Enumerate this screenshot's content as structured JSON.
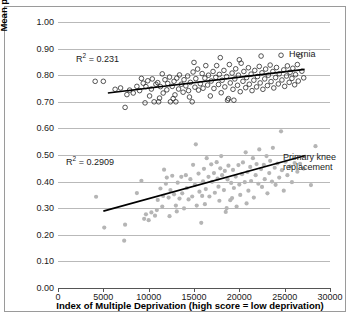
{
  "chart_data": {
    "type": "scatter",
    "title": "",
    "xlabel": "Index of Multiple Deprivation (high score = low deprivation)",
    "ylabel": "Mean pre operative EQ 5D index score",
    "xlim": [
      0,
      30000
    ],
    "ylim": [
      0.0,
      1.0
    ],
    "xticks": [
      "0",
      "5000",
      "10000",
      "15000",
      "20000",
      "25000",
      "30000"
    ],
    "xtick_values": [
      0,
      5000,
      10000,
      15000,
      20000,
      25000,
      30000
    ],
    "yticks": [
      "0.00",
      "0.10",
      "0.20",
      "0.30",
      "0.40",
      "0.50",
      "0.60",
      "0.70",
      "0.80",
      "0.90",
      "1.00"
    ],
    "ytick_values": [
      0.0,
      0.1,
      0.2,
      0.3,
      0.4,
      0.5,
      0.6,
      0.7,
      0.8,
      0.9,
      1.0
    ],
    "grid": true,
    "legend_position": "inline-annotation",
    "series": [
      {
        "name": "Hernia",
        "marker": "open-circle",
        "color": "#2b2b2b",
        "r_squared_label": "0.231",
        "trendline": {
          "x0": 5500,
          "y0": 0.733,
          "x1": 27200,
          "y1": 0.822
        },
        "points": [
          [
            4100,
            0.777
          ],
          [
            5000,
            0.777
          ],
          [
            6300,
            0.747
          ],
          [
            6900,
            0.752
          ],
          [
            7400,
            0.679
          ],
          [
            7600,
            0.727
          ],
          [
            7900,
            0.744
          ],
          [
            8300,
            0.733
          ],
          [
            8700,
            0.758
          ],
          [
            9000,
            0.742
          ],
          [
            9200,
            0.788
          ],
          [
            9400,
            0.77
          ],
          [
            9600,
            0.696
          ],
          [
            9700,
            0.757
          ],
          [
            9900,
            0.779
          ],
          [
            10100,
            0.722
          ],
          [
            10300,
            0.748
          ],
          [
            10400,
            0.786
          ],
          [
            10600,
            0.7
          ],
          [
            10800,
            0.766
          ],
          [
            11000,
            0.772
          ],
          [
            11100,
            0.7
          ],
          [
            11300,
            0.757
          ],
          [
            11500,
            0.805
          ],
          [
            11600,
            0.733
          ],
          [
            11800,
            0.783
          ],
          [
            12000,
            0.745
          ],
          [
            12100,
            0.769
          ],
          [
            12300,
            0.793
          ],
          [
            12400,
            0.7
          ],
          [
            12600,
            0.758
          ],
          [
            12800,
            0.777
          ],
          [
            12900,
            0.726
          ],
          [
            13100,
            0.789
          ],
          [
            13300,
            0.748
          ],
          [
            13400,
            0.801
          ],
          [
            13600,
            0.766
          ],
          [
            13800,
            0.736
          ],
          [
            13900,
            0.783
          ],
          [
            14100,
            0.76
          ],
          [
            14300,
            0.797
          ],
          [
            14400,
            0.742
          ],
          [
            14600,
            0.773
          ],
          [
            14800,
            0.7
          ],
          [
            14900,
            0.812
          ],
          [
            15100,
            0.755
          ],
          [
            15200,
            0.787
          ],
          [
            15400,
            0.823
          ],
          [
            15500,
            0.744
          ],
          [
            15700,
            0.768
          ],
          [
            15900,
            0.806
          ],
          [
            16000,
            0.751
          ],
          [
            16200,
            0.789
          ],
          [
            16300,
            0.836
          ],
          [
            16500,
            0.763
          ],
          [
            16600,
            0.8
          ],
          [
            16800,
            0.722
          ],
          [
            16900,
            0.778
          ],
          [
            17100,
            0.814
          ],
          [
            17200,
            0.75
          ],
          [
            17400,
            0.792
          ],
          [
            17500,
            0.836
          ],
          [
            17700,
            0.765
          ],
          [
            17800,
            0.803
          ],
          [
            18000,
            0.734
          ],
          [
            18100,
            0.781
          ],
          [
            18300,
            0.818
          ],
          [
            18400,
            0.756
          ],
          [
            18600,
            0.795
          ],
          [
            18700,
            0.706
          ],
          [
            18900,
            0.84
          ],
          [
            19000,
            0.771
          ],
          [
            19200,
            0.808
          ],
          [
            19300,
            0.747
          ],
          [
            19500,
            0.786
          ],
          [
            19600,
            0.824
          ],
          [
            19800,
            0.762
          ],
          [
            19900,
            0.8
          ],
          [
            20100,
            0.738
          ],
          [
            20200,
            0.845
          ],
          [
            20400,
            0.777
          ],
          [
            20500,
            0.814
          ],
          [
            20700,
            0.753
          ],
          [
            20800,
            0.791
          ],
          [
            21000,
            0.828
          ],
          [
            21100,
            0.766
          ],
          [
            21300,
            0.804
          ],
          [
            21400,
            0.742
          ],
          [
            21600,
            0.781
          ],
          [
            21700,
            0.818
          ],
          [
            21900,
            0.756
          ],
          [
            22000,
            0.795
          ],
          [
            22200,
            0.833
          ],
          [
            22300,
            0.771
          ],
          [
            22500,
            0.809
          ],
          [
            22600,
            0.747
          ],
          [
            22800,
            0.786
          ],
          [
            22900,
            0.823
          ],
          [
            23100,
            0.761
          ],
          [
            23200,
            0.8
          ],
          [
            23400,
            0.838
          ],
          [
            23500,
            0.776
          ],
          [
            23700,
            0.814
          ],
          [
            23800,
            0.752
          ],
          [
            24000,
            0.791
          ],
          [
            24100,
            0.829
          ],
          [
            24300,
            0.767
          ],
          [
            24400,
            0.805
          ],
          [
            24600,
            0.875
          ],
          [
            24700,
            0.782
          ],
          [
            24900,
            0.82
          ],
          [
            25000,
            0.758
          ],
          [
            25200,
            0.797
          ],
          [
            25300,
            0.835
          ],
          [
            25500,
            0.773
          ],
          [
            25600,
            0.811
          ],
          [
            25800,
            0.788
          ],
          [
            25900,
            0.826
          ],
          [
            26100,
            0.764
          ],
          [
            26200,
            0.802
          ],
          [
            26400,
            0.84
          ],
          [
            26500,
            0.778
          ],
          [
            26700,
            0.871
          ],
          [
            26900,
            0.815
          ],
          [
            27100,
            0.79
          ],
          [
            13000,
            0.7
          ],
          [
            15000,
            0.848
          ],
          [
            17900,
            0.866
          ],
          [
            20000,
            0.858
          ],
          [
            22400,
            0.872
          ],
          [
            11200,
            0.714
          ],
          [
            12700,
            0.712
          ],
          [
            18800,
            0.712
          ],
          [
            19400,
            0.706
          ],
          [
            14500,
            0.718
          ]
        ]
      },
      {
        "name": "Primary knee replacement",
        "marker": "filled-circle",
        "color": "#b5b5b5",
        "r_squared_label": "0.2909",
        "trendline": {
          "x0": 5000,
          "y0": 0.289,
          "x1": 27300,
          "y1": 0.498
        },
        "points": [
          [
            4200,
            0.343
          ],
          [
            5100,
            0.227
          ],
          [
            7300,
            0.178
          ],
          [
            7400,
            0.238
          ],
          [
            8700,
            0.357
          ],
          [
            9200,
            0.403
          ],
          [
            9500,
            0.26
          ],
          [
            9700,
            0.277
          ],
          [
            10000,
            0.255
          ],
          [
            10300,
            0.284
          ],
          [
            10700,
            0.272
          ],
          [
            11000,
            0.331
          ],
          [
            11300,
            0.374
          ],
          [
            11500,
            0.306
          ],
          [
            11700,
            0.445
          ],
          [
            11900,
            0.392
          ],
          [
            12000,
            0.415
          ],
          [
            12200,
            0.34
          ],
          [
            12400,
            0.368
          ],
          [
            12600,
            0.422
          ],
          [
            12800,
            0.352
          ],
          [
            13000,
            0.31
          ],
          [
            13200,
            0.396
          ],
          [
            13400,
            0.336
          ],
          [
            13600,
            0.418
          ],
          [
            13700,
            0.356
          ],
          [
            13900,
            0.299
          ],
          [
            14100,
            0.424
          ],
          [
            14200,
            0.376
          ],
          [
            14400,
            0.333
          ],
          [
            14600,
            0.409
          ],
          [
            14800,
            0.344
          ],
          [
            14900,
            0.463
          ],
          [
            15100,
            0.388
          ],
          [
            15200,
            0.54
          ],
          [
            15300,
            0.31
          ],
          [
            15500,
            0.43
          ],
          [
            15600,
            0.362
          ],
          [
            15800,
            0.245
          ],
          [
            16000,
            0.401
          ],
          [
            16100,
            0.448
          ],
          [
            16300,
            0.372
          ],
          [
            16400,
            0.488
          ],
          [
            16600,
            0.418
          ],
          [
            16700,
            0.344
          ],
          [
            16900,
            0.465
          ],
          [
            17000,
            0.399
          ],
          [
            17200,
            0.432
          ],
          [
            17300,
            0.358
          ],
          [
            17500,
            0.473
          ],
          [
            17600,
            0.411
          ],
          [
            17700,
            0.381
          ],
          [
            17900,
            0.45
          ],
          [
            18000,
            0.496
          ],
          [
            18100,
            0.424
          ],
          [
            18300,
            0.368
          ],
          [
            18400,
            0.44
          ],
          [
            18500,
            0.286
          ],
          [
            18700,
            0.408
          ],
          [
            18800,
            0.46
          ],
          [
            19000,
            0.33
          ],
          [
            19100,
            0.395
          ],
          [
            19300,
            0.444
          ],
          [
            19400,
            0.376
          ],
          [
            19600,
            0.419
          ],
          [
            19700,
            0.306
          ],
          [
            19900,
            0.462
          ],
          [
            20000,
            0.389
          ],
          [
            20100,
            0.35
          ],
          [
            20300,
            0.428
          ],
          [
            20400,
            0.472
          ],
          [
            20600,
            0.398
          ],
          [
            20700,
            0.51
          ],
          [
            20900,
            0.436
          ],
          [
            21000,
            0.366
          ],
          [
            21200,
            0.455
          ],
          [
            21300,
            0.402
          ],
          [
            21500,
            0.488
          ],
          [
            21600,
            0.34
          ],
          [
            21800,
            0.424
          ],
          [
            21900,
            0.466
          ],
          [
            22100,
            0.392
          ],
          [
            22200,
            0.521
          ],
          [
            22400,
            0.447
          ],
          [
            22500,
            0.38
          ],
          [
            22700,
            0.463
          ],
          [
            22800,
            0.409
          ],
          [
            23000,
            0.496
          ],
          [
            23100,
            0.356
          ],
          [
            23300,
            0.432
          ],
          [
            23400,
            0.478
          ],
          [
            23600,
            0.4
          ],
          [
            23700,
            0.527
          ],
          [
            23900,
            0.452
          ],
          [
            24000,
            0.388
          ],
          [
            24200,
            0.468
          ],
          [
            24400,
            0.415
          ],
          [
            24600,
            0.589
          ],
          [
            24700,
            0.443
          ],
          [
            24900,
            0.366
          ],
          [
            25100,
            0.475
          ],
          [
            25300,
            0.424
          ],
          [
            25600,
            0.456
          ],
          [
            25800,
            0.398
          ],
          [
            26100,
            0.47
          ],
          [
            26400,
            0.437
          ],
          [
            26700,
            0.467
          ],
          [
            27100,
            0.449
          ],
          [
            27900,
            0.387
          ],
          [
            28400,
            0.533
          ],
          [
            12300,
            0.27
          ],
          [
            13100,
            0.288
          ],
          [
            11600,
            0.346
          ],
          [
            10900,
            0.293
          ],
          [
            16200,
            0.315
          ],
          [
            17800,
            0.328
          ],
          [
            19200,
            0.338
          ],
          [
            20800,
            0.318
          ],
          [
            15900,
            0.346
          ],
          [
            18600,
            0.3
          ]
        ]
      }
    ],
    "annotations": [
      {
        "name": "hernia-r2",
        "text_prefix": "R",
        "text_sup": "2",
        "text_suffix": " = 0.231"
      },
      {
        "name": "knee-r2",
        "text_prefix": "R",
        "text_sup": "2",
        "text_suffix": " = 0.2909"
      },
      {
        "name": "hernia-series-label",
        "text": "Hernia"
      },
      {
        "name": "knee-series-label-line1",
        "text": "Primary knee"
      },
      {
        "name": "knee-series-label-line2",
        "text": "replacement"
      }
    ]
  },
  "axis": {
    "y_title": "Mean pre operative EQ 5D index score",
    "x_title": "Index of Multiple Deprivation (high score = low deprivation)"
  },
  "colors": {
    "grid": "#b9b9b9",
    "axis": "#555555",
    "hernia_marker": "#2b2b2b",
    "knee_marker": "#b5b5b5",
    "trendline": "#000000",
    "frame": "#9a9a9a"
  }
}
